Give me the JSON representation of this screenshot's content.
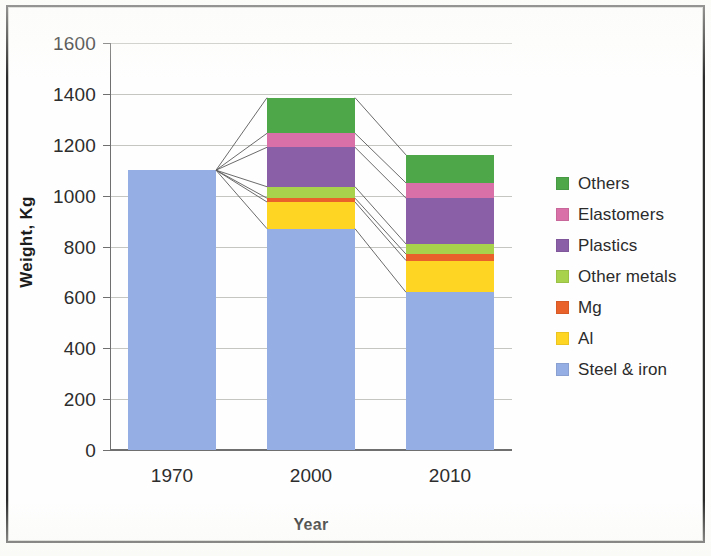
{
  "chart_data": {
    "type": "bar",
    "subtype": "stacked-bar",
    "title": "",
    "xlabel": "Year",
    "ylabel": "Weight, Kg",
    "categories": [
      "1970",
      "2000",
      "2010"
    ],
    "ylim": [
      0,
      1600
    ],
    "yticks": [
      0,
      200,
      400,
      600,
      800,
      1000,
      1200,
      1400,
      1600
    ],
    "grid": true,
    "legend_position": "right",
    "stack_order_bottom_to_top": [
      "Steel & iron",
      "Al",
      "Mg",
      "Other metals",
      "Plastics",
      "Elastomers",
      "Others"
    ],
    "series": [
      {
        "name": "Steel & iron",
        "color": "#95AEE3",
        "values": [
          1100,
          870,
          620
        ]
      },
      {
        "name": "Al",
        "color": "#FFD524",
        "values": [
          0,
          105,
          125
        ]
      },
      {
        "name": "Mg",
        "color": "#E8622A",
        "values": [
          0,
          15,
          25
        ]
      },
      {
        "name": "Other metals",
        "color": "#A8D24B",
        "values": [
          0,
          45,
          40
        ]
      },
      {
        "name": "Plastics",
        "color": "#8B5FA8",
        "values": [
          0,
          155,
          180
        ]
      },
      {
        "name": "Elastomers",
        "color": "#D970A8",
        "values": [
          0,
          55,
          60
        ]
      },
      {
        "name": "Others",
        "color": "#4EA849",
        "values": [
          0,
          140,
          110
        ]
      }
    ],
    "totals": [
      1100,
      1385,
      1160
    ],
    "annotations": [
      "Connector lines fan out from the 1970 bar top to each 2000 stack boundary",
      "Connector lines link each 2000 stack boundary to the matching 2010 boundary"
    ]
  },
  "axes": {
    "y_title": "Weight, Kg",
    "x_title": "Year",
    "y_tick_labels": [
      "1600",
      "1400",
      "1200",
      "1000",
      "800",
      "600",
      "400",
      "200",
      "0"
    ],
    "x_tick_labels": [
      "1970",
      "2000",
      "2010"
    ]
  },
  "legend": {
    "items": [
      {
        "label": "Others",
        "color": "#4EA849"
      },
      {
        "label": "Elastomers",
        "color": "#D970A8"
      },
      {
        "label": "Plastics",
        "color": "#8B5FA8"
      },
      {
        "label": "Other metals",
        "color": "#A8D24B"
      },
      {
        "label": "Mg",
        "color": "#E8622A"
      },
      {
        "label": "Al",
        "color": "#FFD524"
      },
      {
        "label": "Steel & iron",
        "color": "#95AEE3"
      }
    ]
  },
  "colors": {
    "others": "#4EA849",
    "elastomers": "#D970A8",
    "plastics": "#8B5FA8",
    "other_metals": "#A8D24B",
    "mg": "#E8622A",
    "al": "#FFD524",
    "steel_iron": "#95AEE3",
    "gridline": "#C5C5C2",
    "axis": "#6F6F6F",
    "text": "#2D2D2D",
    "connector": "#5A5A5A",
    "page_border": "#2B2B2B"
  }
}
